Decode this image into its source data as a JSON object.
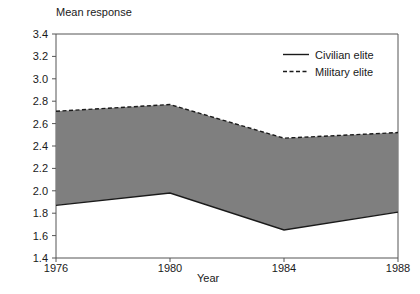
{
  "chart_data": {
    "type": "area",
    "title": "",
    "ylabel": "Mean response",
    "xlabel": "Year",
    "categories": [
      "1976",
      "1980",
      "1984",
      "1988"
    ],
    "x": [
      1976,
      1980,
      1984,
      1988
    ],
    "xlim": [
      1976,
      1988
    ],
    "ylim": [
      1.4,
      3.4
    ],
    "grid": false,
    "legend_position": "top-right",
    "yticks": [
      "3.4",
      "3.2",
      "3.0",
      "2.8",
      "2.6",
      "2.4",
      "2.2",
      "2.0",
      "1.8",
      "1.6",
      "1.4"
    ],
    "ytick_values": [
      3.4,
      3.2,
      3.0,
      2.8,
      2.6,
      2.4,
      2.2,
      2.0,
      1.8,
      1.6,
      1.4
    ],
    "xticks": [
      "1976",
      "1980",
      "1984",
      "1988"
    ],
    "fill_between": true,
    "fill_color": "#7f7f7f",
    "series": [
      {
        "name": "Military elite",
        "style": "dashed",
        "color": "#1a1a1a",
        "values": [
          2.71,
          2.77,
          2.47,
          2.52
        ]
      },
      {
        "name": "Civilian elite",
        "style": "solid",
        "color": "#1a1a1a",
        "values": [
          1.87,
          1.98,
          1.65,
          1.81
        ]
      }
    ]
  },
  "legend": {
    "items": [
      {
        "label": "Civilian elite",
        "style": "solid"
      },
      {
        "label": "Military elite",
        "style": "dashed"
      }
    ]
  },
  "colors": {
    "area_fill": "#7f7f7f",
    "line": "#1a1a1a",
    "axis": "#555555",
    "text": "#1a1a1a",
    "background": "#ffffff"
  }
}
